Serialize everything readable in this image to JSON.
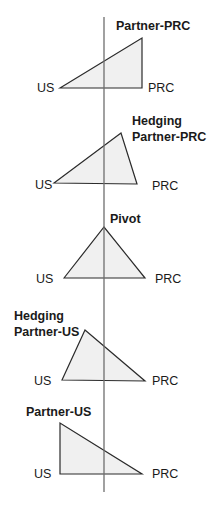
{
  "diagram": {
    "axis": {
      "x": 104,
      "y1": 17,
      "y2": 492,
      "color": "#6e6e6e"
    },
    "style": {
      "stroke": "#2b2b2b",
      "fill": "#f0f0f0"
    },
    "triangles": [
      {
        "name": "partner-prc",
        "title_lines": [
          "Partner-PRC"
        ],
        "left_label": "US",
        "right_label": "PRC",
        "points": "60,88 142,38 142,88"
      },
      {
        "name": "hedging-partner-prc",
        "title_lines": [
          "Hedging",
          "Partner-PRC"
        ],
        "left_label": "US",
        "right_label": "PRC",
        "points": "54,183 121,133 137,184"
      },
      {
        "name": "pivot",
        "title_lines": [
          "Pivot"
        ],
        "left_label": "US",
        "right_label": "PRC",
        "points": "64,278 104,227 145,278"
      },
      {
        "name": "hedging-partner-us",
        "title_lines": [
          "Hedging",
          "Partner-US"
        ],
        "left_label": "US",
        "right_label": "PRC",
        "points": "62,380 85,330 145,381"
      },
      {
        "name": "partner-us",
        "title_lines": [
          "Partner-US"
        ],
        "left_label": "US",
        "right_label": "PRC",
        "points": "60,474 60,423 142,474"
      }
    ]
  }
}
